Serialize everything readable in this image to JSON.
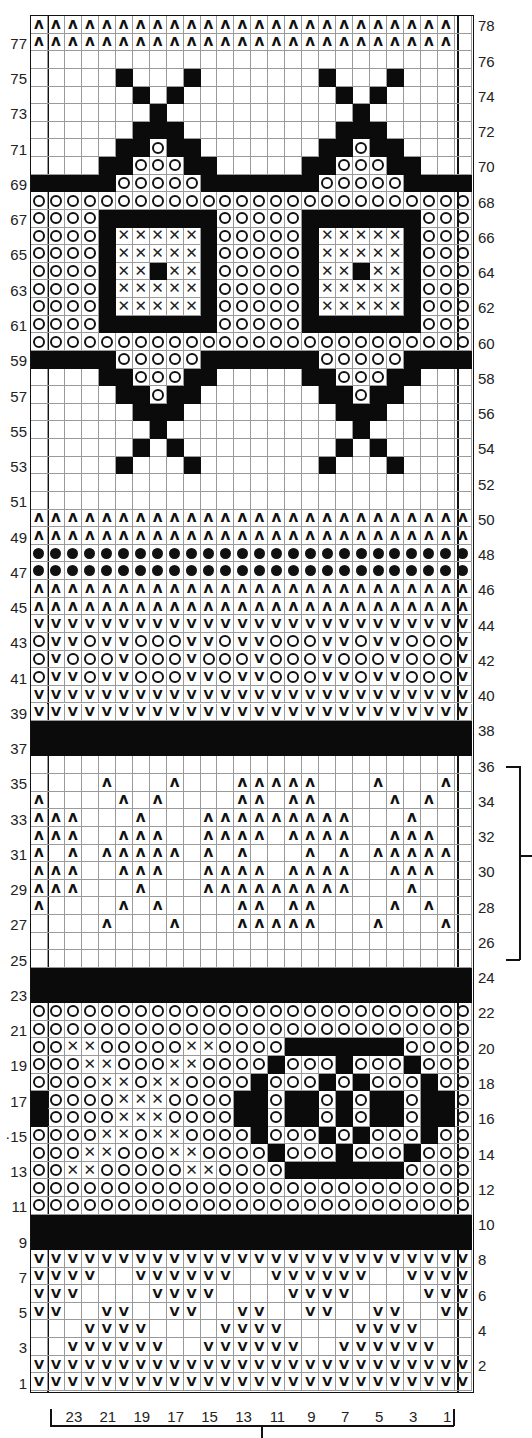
{
  "grid": {
    "columns": 26,
    "rows": 78
  },
  "legend_codes": {
    ".": "blank",
    "B": "solid-black",
    "o": "circle",
    "X": "cross",
    "^": "caret",
    "V": "vee",
    "*": "dot"
  },
  "rows_top_to_bottom": [
    {
      "n": 78,
      "p": "^^^^^^^^^^^^^^^^^^^^^^^^^."
    },
    {
      "n": 77,
      "p": "^^^^^^^^^^^^^^^^^^^^^^^^^."
    },
    {
      "n": 76,
      "p": ".........................."
    },
    {
      "n": 75,
      "p": ".....B...B.......B...B...."
    },
    {
      "n": 74,
      "p": "......B.B.........B.B....."
    },
    {
      "n": 73,
      "p": ".......B...........B......"
    },
    {
      "n": 72,
      "p": "......BBB.........BBB....."
    },
    {
      "n": 71,
      "p": ".....BBoBB.......BBoBB...."
    },
    {
      "n": 70,
      "p": "....BBoooBB.....BBoooBB..."
    },
    {
      "n": 69,
      "p": "BBBBBoooooBBBBBBBoooooBBBB"
    },
    {
      "n": 68,
      "p": "oooooooooooooooooooooooooo"
    },
    {
      "n": 67,
      "p": "ooooBBBBBBBoooooBBBBBBBooo"
    },
    {
      "n": 66,
      "p": "ooooBXXXXXBoooooBXXXXXBooo"
    },
    {
      "n": 65,
      "p": "ooooBXXXXXBoooooBXXXXXBooo"
    },
    {
      "n": 64,
      "p": "ooooBXXBXXBoooooBXXBXXBooo"
    },
    {
      "n": 63,
      "p": "ooooBXXXXXBoooooBXXXXXBooo"
    },
    {
      "n": 62,
      "p": "ooooBXXXXXBoooooBXXXXXBooo"
    },
    {
      "n": 61,
      "p": "ooooBBBBBBBoooooBBBBBBBooo"
    },
    {
      "n": 60,
      "p": "oooooooooooooooooooooooooo"
    },
    {
      "n": 59,
      "p": "BBBBBoooooBBBBBBBoooooBBBB"
    },
    {
      "n": 58,
      "p": "....BBoooBB.....BBoooBB..."
    },
    {
      "n": 57,
      "p": ".....BBoBB.......BBoBB...."
    },
    {
      "n": 56,
      "p": "......BBB.........BBB....."
    },
    {
      "n": 55,
      "p": ".......B...........B......"
    },
    {
      "n": 54,
      "p": "......B.B.........B.B....."
    },
    {
      "n": 53,
      "p": ".....B...B.......B...B...."
    },
    {
      "n": 52,
      "p": ".........................."
    },
    {
      "n": 51,
      "p": ".........................."
    },
    {
      "n": 50,
      "p": "^^^^^^^^^^^^^^^^^^^^^^^^^^"
    },
    {
      "n": 49,
      "p": "^^^^^^^^^^^^^^^^^^^^^^^^^^"
    },
    {
      "n": 48,
      "p": "**************************"
    },
    {
      "n": 47,
      "p": "**************************"
    },
    {
      "n": 46,
      "p": "^^^^^^^^^^^^^^^^^^^^^^^^^^"
    },
    {
      "n": 45,
      "p": "^^^^^^^^^^^^^^^^^^^^^^^^^^"
    },
    {
      "n": 44,
      "p": "VVVVVVVVVVVVVVVVVVVVVVVVVV"
    },
    {
      "n": 43,
      "p": "oVVoVVoooVVoVVoooVVoVVoooV"
    },
    {
      "n": 42,
      "p": "oVoooVoooVoooVoooVoooVoooV"
    },
    {
      "n": 41,
      "p": "oVVoVVoooVVoVVoooVVoVVoooV"
    },
    {
      "n": 40,
      "p": "VVVVVVVVVVVVVVVVVVVVVVVVVV"
    },
    {
      "n": 39,
      "p": "VVVVVVVVVVVVVVVVVVVVVVVVVV"
    },
    {
      "n": 38,
      "p": "BBBBBBBBBBBBBBBBBBBBBBBBBB"
    },
    {
      "n": 37,
      "p": "BBBBBBBBBBBBBBBBBBBBBBBBBB"
    },
    {
      "n": 36,
      "p": ".........................."
    },
    {
      "n": 35,
      "p": "....^...^...^^^^^...^...^."
    },
    {
      "n": 34,
      "p": "^....^.^....^^.^^....^.^.."
    },
    {
      "n": 33,
      "p": "^^^...^...^^^^^^^^^...^..."
    },
    {
      "n": 32,
      "p": "^^^..^^^..^^^^.^^^^..^^^.."
    },
    {
      "n": 31,
      "p": "^.^.^^^^^.^.^...^.^.^^^^^."
    },
    {
      "n": 30,
      "p": "^^^..^^^..^^^^.^^^^..^^^.."
    },
    {
      "n": 29,
      "p": "^^^...^...^^^^^^^^^...^..."
    },
    {
      "n": 28,
      "p": "^....^.^....^^.^^....^.^.."
    },
    {
      "n": 27,
      "p": "....^...^...^^^^^...^...^."
    },
    {
      "n": 26,
      "p": ".........................."
    },
    {
      "n": 25,
      "p": ".........................."
    },
    {
      "n": 24,
      "p": "BBBBBBBBBBBBBBBBBBBBBBBBBB"
    },
    {
      "n": 23,
      "p": "BBBBBBBBBBBBBBBBBBBBBBBBBB"
    },
    {
      "n": 22,
      "p": "oooooooooooooooooooooooooo"
    },
    {
      "n": 21,
      "p": "oooooooooooooooooooooooooo"
    },
    {
      "n": 20,
      "p": "ooXXoooooXXooooBBBBBBBoooo"
    },
    {
      "n": 19,
      "p": "oooXXoooXXooooBoooBoooBooo"
    },
    {
      "n": 18,
      "p": "ooooXXoXXooooBoooBoBoooBoo"
    },
    {
      "n": 17,
      "p": "BooooXXXooooBBoBBoBoBBoBBo"
    },
    {
      "n": 16,
      "p": "BooooXXXooooBBoBBoBoBBoBBo"
    },
    {
      "n": 15,
      "p": "ooooXXoXXooooBoooBoBoooBoo"
    },
    {
      "n": 14,
      "p": "oooXXoooXXooooBoooBoooBooo"
    },
    {
      "n": 13,
      "p": "ooXXoooooXXooooBBBBBBBoooo"
    },
    {
      "n": 12,
      "p": "oooooooooooooooooooooooooo"
    },
    {
      "n": 11,
      "p": "oooooooooooooooooooooooooo"
    },
    {
      "n": 10,
      "p": "BBBBBBBBBBBBBBBBBBBBBBBBBB"
    },
    {
      "n": 9,
      "p": "BBBBBBBBBBBBBBBBBBBBBBBBBB"
    },
    {
      "n": 8,
      "p": "VVVVVVVVVVVVVVVVVVVVVVVVVV"
    },
    {
      "n": 7,
      "p": "VVVV..VVVVVV..VVVVVV..VVVV"
    },
    {
      "n": 6,
      "p": "VVV....VVVV....VVVV....VVV"
    },
    {
      "n": 5,
      "p": "VV..VV..VV..VV..VV..VV..VV"
    },
    {
      "n": 4,
      "p": "...VVVV....VVVV....VVVV..."
    },
    {
      "n": 3,
      "p": "..VVVVVV..VVVVVV..VVVVVV.."
    },
    {
      "n": 2,
      "p": "VVVVVVVVVVVVVVVVVVVVVVVVVV"
    },
    {
      "n": 1,
      "p": "VVVVVVVVVVVVVVVVVVVVVVVVVV"
    }
  ],
  "left_row_labels": [
    "77",
    "75",
    "73",
    "71",
    "69",
    "67",
    "65",
    "63",
    "61",
    "59",
    "57",
    "55",
    "53",
    "51",
    "49",
    "47",
    "45",
    "43",
    "41",
    "39",
    "37",
    "35",
    "33",
    "31",
    "29",
    "27",
    "25",
    "23",
    "21",
    "19",
    "17",
    "·15",
    "13",
    "11",
    "9",
    "7",
    "5",
    "3",
    "1"
  ],
  "right_row_labels": [
    "78",
    "76",
    "74",
    "72",
    "70",
    "68",
    "66",
    "64",
    "62",
    "60",
    "58",
    "56",
    "54",
    "52",
    "50",
    "48",
    "46",
    "44",
    "42",
    "40",
    "38",
    "36",
    "34",
    "32",
    "30",
    "28",
    "26",
    "24",
    "22",
    "20",
    "18",
    "16",
    "14",
    "12",
    "10",
    "8",
    "6",
    "4",
    "2"
  ],
  "bottom_stitch_labels": [
    "23",
    "21",
    "19",
    "17",
    "15",
    "13",
    "11",
    "9",
    "7",
    "5",
    "3",
    "1"
  ],
  "symbols": {
    "caret": "ʌ",
    "vee": "V",
    "cross": "✕"
  },
  "colors": {
    "ink": "#111111",
    "grid": "#9a9a9a",
    "paper": "#ffffff"
  }
}
